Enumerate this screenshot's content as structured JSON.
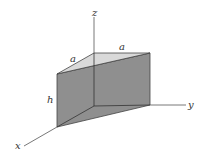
{
  "diagram": {
    "type": "triangular-prism-3d",
    "axes": {
      "x": "x",
      "y": "y",
      "z": "z"
    },
    "dimensions": {
      "edge_a_left": "a",
      "edge_a_top": "a",
      "height": "h"
    },
    "colors": {
      "side_face": "#8f8f8f",
      "top_face": "#d9d9d9",
      "edge": "#444444",
      "axis": "#555555"
    }
  }
}
